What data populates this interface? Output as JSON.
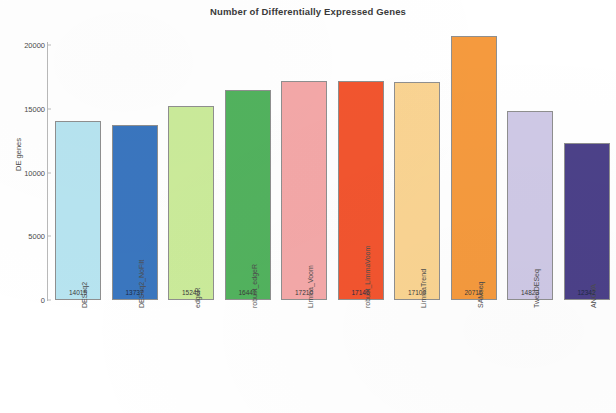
{
  "chart_data": {
    "type": "bar",
    "title": "Number of Differentially Expressed Genes",
    "xlabel": "",
    "ylabel": "DE genes",
    "ylim": [
      0,
      21000
    ],
    "yticks": [
      0,
      5000,
      10000,
      15000,
      20000
    ],
    "ytick_labels": [
      "0",
      "5000",
      "10000",
      "15000",
      "20000"
    ],
    "grid": false,
    "legend": "none",
    "categories": [
      "DESeq2",
      "DESeq2_NoFilt",
      "edgeR",
      "robust_edgeR",
      "Limma_Voom",
      "robust_LimmaVoom",
      "LimmaTrend",
      "SAMseq",
      "TweeDESeq",
      "ANOVA"
    ],
    "values": [
      14015,
      13737,
      15249,
      16441,
      17210,
      17146,
      17109,
      20716,
      14823,
      12342
    ],
    "value_labels": [
      "14015",
      "13737",
      "15249",
      "16441",
      "17210",
      "17146",
      "17109",
      "20716",
      "14823",
      "12342"
    ],
    "bar_colors": [
      "#b7e4f0",
      "#3a76bf",
      "#cbeb9a",
      "#52b25e",
      "#f4a8a8",
      "#f2552f",
      "#fad492",
      "#f59a3e",
      "#cfc9e6",
      "#4c4189"
    ],
    "bar_edge_color": "#8f8f8f"
  },
  "axis": {
    "y_label": "DE genes"
  }
}
